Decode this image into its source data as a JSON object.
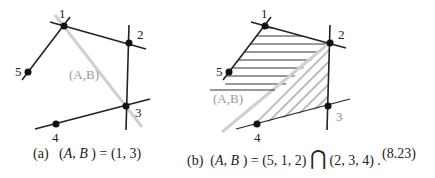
{
  "figure": {
    "equation_number": "(8.23)",
    "panels": [
      {
        "id": "a",
        "caption_prefix": "(a)",
        "caption_lhs_A": "A",
        "caption_lhs_B": "B",
        "caption_rhs": "= (1, 3)",
        "line_label": "(A,B)",
        "node_labels": [
          "1",
          "2",
          "3",
          "4",
          "5"
        ]
      },
      {
        "id": "b",
        "caption_prefix": "(b)",
        "caption_lhs_A": "A",
        "caption_lhs_B": "B",
        "caption_rhs_1": "= (5, 1, 2)",
        "caption_op": "⋂",
        "caption_rhs_2": "(2, 3, 4) .",
        "line_label": "(A,B)",
        "node_labels": [
          "1",
          "2",
          "3",
          "4",
          "5"
        ]
      }
    ],
    "colors": {
      "line": "#222222",
      "cut_line": "#cccccc",
      "label_gray": "#999999"
    }
  }
}
